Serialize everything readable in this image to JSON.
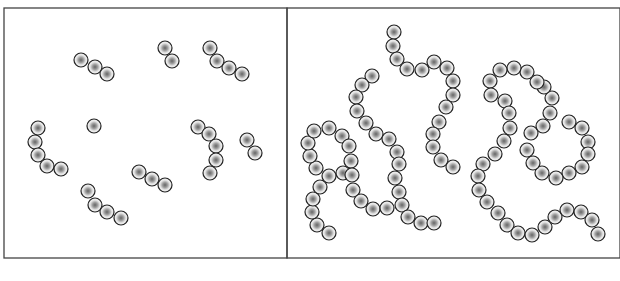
{
  "figure": {
    "panels": [
      {
        "id": "left",
        "frame": {
          "x": 4,
          "y": 8,
          "w": 283,
          "h": 250
        },
        "chains": [
          [
            [
              81,
              60
            ],
            [
              95,
              67
            ],
            [
              107,
              74
            ]
          ],
          [
            [
              165,
              48
            ],
            [
              172,
              61
            ]
          ],
          [
            [
              210,
              48
            ],
            [
              217,
              61
            ],
            [
              229,
              68
            ],
            [
              242,
              74
            ]
          ],
          [
            [
              38,
              128
            ],
            [
              35,
              142
            ],
            [
              38,
              155
            ],
            [
              47,
              166
            ],
            [
              61,
              169
            ]
          ],
          [
            [
              94,
              126
            ]
          ],
          [
            [
              198,
              127
            ],
            [
              209,
              134
            ],
            [
              216,
              146
            ],
            [
              216,
              160
            ],
            [
              210,
              173
            ]
          ],
          [
            [
              247,
              140
            ],
            [
              255,
              153
            ]
          ],
          [
            [
              139,
              172
            ],
            [
              152,
              179
            ],
            [
              165,
              185
            ]
          ],
          [
            [
              88,
              191
            ],
            [
              95,
              205
            ],
            [
              107,
              212
            ],
            [
              121,
              218
            ]
          ]
        ]
      },
      {
        "id": "right",
        "frame": {
          "x": 287,
          "y": 8,
          "w": 333,
          "h": 250
        },
        "chains": [
          [
            [
              372,
              76
            ],
            [
              362,
              85
            ],
            [
              356,
              97
            ],
            [
              357,
              111
            ],
            [
              366,
              123
            ],
            [
              376,
              134
            ],
            [
              389,
              139
            ],
            [
              397,
              152
            ],
            [
              399,
              164
            ],
            [
              395,
              178
            ],
            [
              399,
              192
            ],
            [
              402,
              205
            ],
            [
              408,
              217
            ],
            [
              421,
              223
            ],
            [
              434,
              223
            ]
          ],
          [
            [
              329,
              233
            ],
            [
              317,
              225
            ],
            [
              312,
              212
            ],
            [
              313,
              199
            ],
            [
              320,
              187
            ],
            [
              329,
              176
            ],
            [
              316,
              168
            ],
            [
              310,
              156
            ],
            [
              308,
              143
            ],
            [
              314,
              131
            ],
            [
              329,
              128
            ],
            [
              342,
              136
            ],
            [
              349,
              146
            ],
            [
              351,
              161
            ],
            [
              343,
              173
            ],
            [
              352,
              175
            ],
            [
              353,
              190
            ],
            [
              361,
              201
            ],
            [
              373,
              209
            ],
            [
              387,
              208
            ]
          ],
          [
            [
              394,
              32
            ],
            [
              393,
              46
            ],
            [
              397,
              59
            ],
            [
              407,
              69
            ],
            [
              422,
              70
            ],
            [
              434,
              62
            ],
            [
              447,
              68
            ],
            [
              453,
              81
            ],
            [
              453,
              95
            ],
            [
              446,
              107
            ],
            [
              439,
              122
            ],
            [
              433,
              134
            ],
            [
              433,
              147
            ],
            [
              441,
              160
            ],
            [
              453,
              167
            ]
          ],
          [
            [
              569,
              122
            ],
            [
              582,
              128
            ],
            [
              588,
              142
            ],
            [
              588,
              154
            ],
            [
              582,
              167
            ],
            [
              569,
              173
            ],
            [
              556,
              178
            ],
            [
              542,
              173
            ],
            [
              533,
              163
            ],
            [
              527,
              150
            ],
            [
              531,
              133
            ],
            [
              543,
              126
            ],
            [
              550,
              113
            ],
            [
              552,
              98
            ],
            [
              544,
              87
            ],
            [
              537,
              82
            ],
            [
              527,
              72
            ],
            [
              514,
              68
            ],
            [
              500,
              70
            ],
            [
              490,
              81
            ],
            [
              491,
              95
            ],
            [
              505,
              101
            ],
            [
              509,
              113
            ],
            [
              510,
              128
            ],
            [
              504,
              141
            ],
            [
              495,
              154
            ],
            [
              483,
              164
            ],
            [
              478,
              176
            ],
            [
              479,
              190
            ],
            [
              487,
              202
            ],
            [
              498,
              213
            ],
            [
              507,
              225
            ],
            [
              518,
              233
            ],
            [
              532,
              235
            ],
            [
              545,
              227
            ],
            [
              555,
              217
            ],
            [
              567,
              210
            ],
            [
              581,
              212
            ],
            [
              592,
              220
            ],
            [
              598,
              234
            ]
          ]
        ]
      }
    ],
    "bead": {
      "radius": 7,
      "stroke": "#222222",
      "fill": "#e6e6e6",
      "core": "#666666"
    },
    "frame_color": "#444444"
  }
}
